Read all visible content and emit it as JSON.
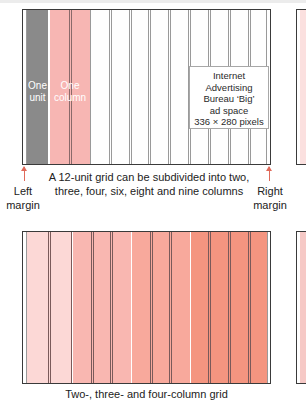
{
  "figure_top": {
    "units": 12,
    "labels": {
      "one_unit_line1": "One",
      "one_unit_line2": "unit",
      "one_column_line1": "One",
      "one_column_line2": "column"
    },
    "ad_box": {
      "line1": "Internet",
      "line2": "Advertising",
      "line3": "Bureau ‘Big’",
      "line4": "ad space",
      "line5": "336 × 280 pixels"
    },
    "caption_line1": "A 12-unit grid can be subdivided into two,",
    "caption_line2": "three, four, six, eight and nine columns",
    "left_margin_line1": "Left",
    "left_margin_line2": "margin",
    "right_margin_line1": "Right",
    "right_margin_line2": "margin"
  },
  "figure_bottom": {
    "caption": "Two-, three- and four-column grid",
    "sections": [
      {
        "columns": 2,
        "color": "#fcd8d6"
      },
      {
        "columns": 3,
        "color": "#f9b7b1"
      },
      {
        "columns": 3,
        "color": "#f8a99c"
      },
      {
        "columns": 4,
        "color": "#f49580"
      }
    ]
  },
  "colors": {
    "unit_gray": "#8a8a8a",
    "column_pink": "#f7b6b3",
    "arrow_red": "#e06a5a",
    "frame": "#3a3a3a"
  }
}
